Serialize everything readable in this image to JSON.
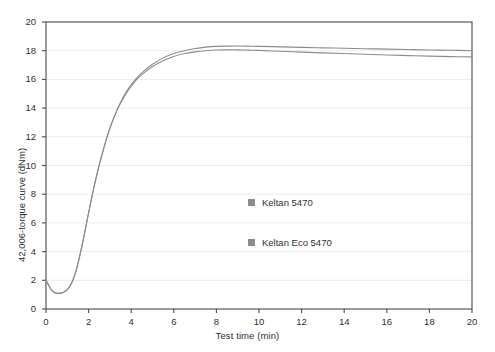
{
  "chart_data": {
    "type": "line",
    "title": "",
    "xlabel": "Test time (min)",
    "ylabel": "42,006-torque curve (dNm)",
    "xlim": [
      0,
      20
    ],
    "ylim": [
      0,
      20
    ],
    "xticks": [
      0,
      2,
      4,
      6,
      8,
      10,
      12,
      14,
      16,
      18,
      20
    ],
    "yticks": [
      0,
      2,
      4,
      6,
      8,
      10,
      12,
      14,
      16,
      18,
      20
    ],
    "grid": "horizontal",
    "legend_position": "center",
    "series": [
      {
        "name": "Keltan 5470",
        "color": "#8c8c8c",
        "x": [
          0.0,
          0.2,
          0.35,
          0.5,
          0.65,
          0.8,
          1.0,
          1.2,
          1.4,
          1.6,
          1.8,
          2.0,
          2.3,
          2.6,
          3.0,
          3.4,
          3.8,
          4.2,
          4.6,
          5.0,
          5.5,
          6.0,
          6.5,
          7.0,
          7.5,
          8.0,
          8.5,
          9.0,
          9.5,
          10.0,
          11.0,
          12.0,
          13.0,
          14.0,
          15.0,
          16.0,
          17.0,
          18.0,
          19.0,
          20.0
        ],
        "y": [
          2.0,
          1.45,
          1.2,
          1.1,
          1.1,
          1.15,
          1.35,
          1.8,
          2.6,
          3.8,
          5.2,
          6.7,
          8.8,
          10.6,
          12.6,
          14.1,
          15.2,
          16.0,
          16.6,
          17.05,
          17.5,
          17.8,
          18.0,
          18.15,
          18.25,
          18.3,
          18.32,
          18.33,
          18.32,
          18.3,
          18.27,
          18.23,
          18.2,
          18.17,
          18.14,
          18.11,
          18.08,
          18.05,
          18.03,
          18.0
        ]
      },
      {
        "name": "Keltan Eco 5470",
        "color": "#8c8c8c",
        "x": [
          0.0,
          0.2,
          0.35,
          0.5,
          0.65,
          0.8,
          1.0,
          1.2,
          1.4,
          1.6,
          1.8,
          2.0,
          2.3,
          2.6,
          3.0,
          3.4,
          3.8,
          4.2,
          4.6,
          5.0,
          5.5,
          6.0,
          6.5,
          7.0,
          7.5,
          8.0,
          8.5,
          9.0,
          9.5,
          10.0,
          11.0,
          12.0,
          13.0,
          14.0,
          15.0,
          16.0,
          17.0,
          18.0,
          19.0,
          20.0
        ],
        "y": [
          2.0,
          1.45,
          1.2,
          1.1,
          1.1,
          1.15,
          1.35,
          1.8,
          2.6,
          3.8,
          5.2,
          6.7,
          8.8,
          10.6,
          12.6,
          14.05,
          15.1,
          15.9,
          16.45,
          16.9,
          17.3,
          17.6,
          17.8,
          17.92,
          18.0,
          18.05,
          18.06,
          18.06,
          18.04,
          18.02,
          17.96,
          17.9,
          17.85,
          17.8,
          17.75,
          17.7,
          17.66,
          17.62,
          17.59,
          17.57
        ]
      }
    ]
  },
  "legend": {
    "items": [
      {
        "label": "Keltan 5470",
        "color": "#8c8c8c"
      },
      {
        "label": "Keltan Eco 5470",
        "color": "#8c8c8c"
      }
    ]
  },
  "colors": {
    "axis": "#4a4a4a",
    "grid": "#ececec",
    "text": "#2f2f2f",
    "curve": "#8c8c8c",
    "background": "#ffffff"
  }
}
